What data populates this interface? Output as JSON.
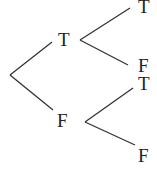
{
  "diagram": {
    "type": "truth-tree",
    "root": {
      "children": [
        {
          "label": "T",
          "children": [
            {
              "label": "T"
            },
            {
              "label": "F"
            }
          ]
        },
        {
          "label": "F",
          "children": [
            {
              "label": "T"
            },
            {
              "label": "F"
            }
          ]
        }
      ]
    },
    "labels": {
      "level1_top": "T",
      "level1_bottom": "F",
      "level2_top_top": "T",
      "level2_top_bottom": "F",
      "level2_bottom_top": "T",
      "level2_bottom_bottom": "F"
    },
    "colors": {
      "line": "#333333",
      "text": "#222222",
      "background": "#ffffff"
    }
  }
}
